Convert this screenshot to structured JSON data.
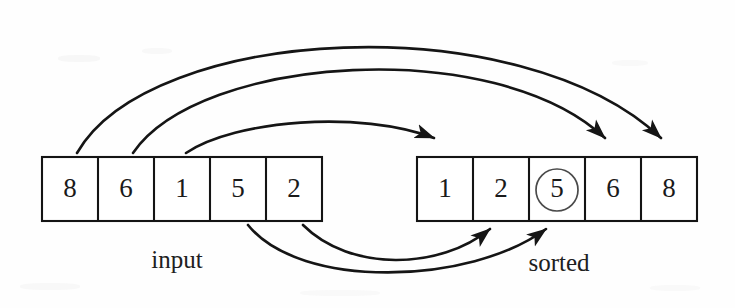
{
  "figure": {
    "width": 735,
    "height": 308,
    "background_color": "#fefefe",
    "ink_color": "#141414",
    "highlight_color": "#4a4a4a"
  },
  "input_array": {
    "label": "input",
    "label_x": 177,
    "label_y": 262,
    "x": 42,
    "y": 157,
    "cell_width": 56,
    "cell_height": 64,
    "cells": [
      {
        "value": "8"
      },
      {
        "value": "6"
      },
      {
        "value": "1"
      },
      {
        "value": "5"
      },
      {
        "value": "2"
      }
    ]
  },
  "sorted_array": {
    "label": "sorted",
    "label_x": 559,
    "label_y": 265,
    "x": 417,
    "y": 157,
    "cell_width": 56,
    "cell_height": 64,
    "cells": [
      {
        "value": "1",
        "circled": false
      },
      {
        "value": "2",
        "circled": false
      },
      {
        "value": "5",
        "circled": true
      },
      {
        "value": "6",
        "circled": false
      },
      {
        "value": "8",
        "circled": false
      }
    ]
  },
  "arrows": [
    {
      "name": "arrow-8-to-slot-5",
      "from_value": "8",
      "to_value": "8",
      "path": "M 77 153 C 150 25 520 5 661 138",
      "head_x": 661,
      "head_y": 138,
      "head_angle": 50
    },
    {
      "name": "arrow-6-to-slot-4",
      "from_value": "6",
      "to_value": "6",
      "path": "M 133 153 C 200 55 495 35 605 138",
      "head_x": 605,
      "head_y": 138,
      "head_angle": 50
    },
    {
      "name": "arrow-1-to-slot-1",
      "from_value": "1",
      "to_value": "1",
      "path": "M 186 153 C 235 120 360 110 434 138",
      "head_x": 434,
      "head_y": 138,
      "head_angle": 42
    },
    {
      "name": "arrow-5-to-slot-3",
      "from_value": "5",
      "to_value": "5",
      "path": "M 248 225 C 300 290 470 285 546 229",
      "head_x": 546,
      "head_y": 229,
      "head_angle": -47
    },
    {
      "name": "arrow-2-to-slot-2",
      "from_value": "2",
      "to_value": "2",
      "path": "M 303 225 C 350 272 440 270 490 229",
      "head_x": 490,
      "head_y": 229,
      "head_angle": -45
    }
  ]
}
